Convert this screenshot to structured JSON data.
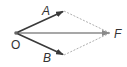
{
  "diagram": {
    "type": "vector-parallelogram",
    "points": {
      "O": {
        "label": "O",
        "x": 16,
        "y": 33
      },
      "A": {
        "label": "A",
        "x": 64,
        "y": 11
      },
      "B": {
        "label": "B",
        "x": 64,
        "y": 55
      },
      "F": {
        "label": "F",
        "x": 110,
        "y": 33
      }
    },
    "vectors": [
      {
        "from": "O",
        "to": "A",
        "style": "solid",
        "color": "#3a3a3a"
      },
      {
        "from": "O",
        "to": "B",
        "style": "solid",
        "color": "#3a3a3a"
      },
      {
        "from": "O",
        "to": "F",
        "style": "solid",
        "color": "#8a8a8a"
      }
    ],
    "guides": [
      {
        "from": "A",
        "to": "F",
        "style": "dashed",
        "color": "#9a9a9a"
      },
      {
        "from": "B",
        "to": "F",
        "style": "dashed",
        "color": "#9a9a9a"
      }
    ]
  }
}
